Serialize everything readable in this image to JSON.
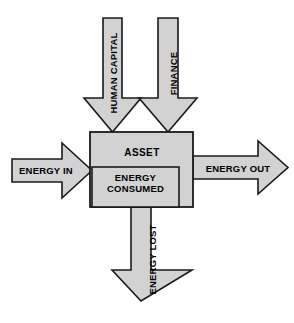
{
  "diagram": {
    "colors": {
      "fill": "#d2d2d2",
      "stroke": "#1a1a1a",
      "background": "#ffffff",
      "text": "#000000"
    },
    "central_box": {
      "label": "ASSET"
    },
    "inner_box": {
      "label": "ENERGY CONSUMED",
      "line_one": "ENERGY",
      "line_two": "CONSUMED"
    },
    "inputs": [
      {
        "name": "human-capital",
        "label": "HUMAN CAPITAL",
        "direction": "down",
        "orientation": "vertical"
      },
      {
        "name": "finance",
        "label": "FINANCE",
        "direction": "down",
        "orientation": "vertical"
      },
      {
        "name": "energy-in",
        "label": "ENERGY IN",
        "direction": "right",
        "orientation": "horizontal"
      }
    ],
    "outputs": [
      {
        "name": "energy-out",
        "label": "ENERGY OUT",
        "direction": "right",
        "orientation": "horizontal"
      },
      {
        "name": "energy-lost",
        "label": "ENERGY LOST",
        "direction": "down",
        "orientation": "vertical"
      }
    ]
  }
}
